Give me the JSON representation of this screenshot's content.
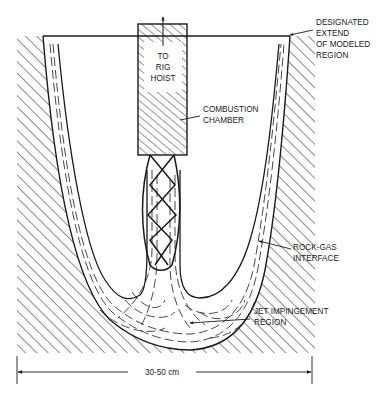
{
  "diagram": {
    "type": "cross-section schematic",
    "colors": {
      "ink": "#1a1a1a",
      "background": "#ffffff"
    },
    "chamber_text": [
      "TO",
      "RIG",
      "HOIST"
    ],
    "labels": {
      "designated": [
        "DESIGNATED",
        "EXTEND",
        "OF MODELED",
        "REGION"
      ],
      "combustion": [
        "COMBUSTION",
        "CHAMBER"
      ],
      "rock_gas": [
        "ROCK-GAS",
        "INTERFACE"
      ],
      "jet": [
        "JET IMPINGEMENT",
        "REGION"
      ]
    },
    "dimension": {
      "label": "30-50 cm"
    }
  }
}
